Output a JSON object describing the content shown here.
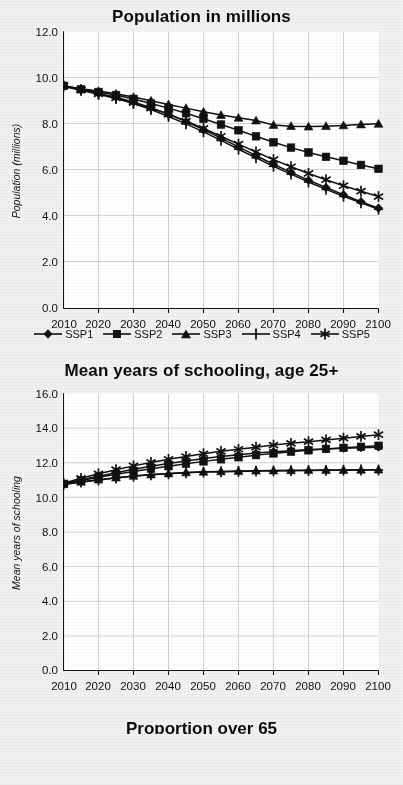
{
  "page": {
    "background_color": "#f1f1ef",
    "plot_background_color": "#ffffff",
    "line_color": "#111111",
    "grid_color": "#cccccc"
  },
  "figure": {
    "panels": [
      {
        "key": "population",
        "title": "Population in millions",
        "ylabel": "Population (millions)",
        "legend_position": "bottom"
      },
      {
        "key": "schooling",
        "title": "Mean years of schooling, age 25+",
        "ylabel": "Mean years of schooling",
        "legend_position": "none"
      }
    ],
    "partial_next_title": "Proportion over 65"
  },
  "legend": {
    "items": [
      {
        "label": "SSP1",
        "marker": "diamond"
      },
      {
        "label": "SSP2",
        "marker": "square"
      },
      {
        "label": "SSP3",
        "marker": "triangle"
      },
      {
        "label": "SSP4",
        "marker": "plus"
      },
      {
        "label": "SSP5",
        "marker": "asterisk"
      }
    ]
  },
  "chart_data": [
    {
      "type": "line",
      "title": "Population in millions",
      "xlabel": "",
      "ylabel": "Population (millions)",
      "xlim": [
        2010,
        2100
      ],
      "ylim": [
        0.0,
        12.0
      ],
      "yticks": [
        "0.0",
        "2.0",
        "4.0",
        "6.0",
        "8.0",
        "10.0",
        "12.0"
      ],
      "xticks": [
        "2010",
        "2020",
        "2030",
        "2040",
        "2050",
        "2060",
        "2070",
        "2080",
        "2090",
        "2100"
      ],
      "grid": true,
      "legend": [
        "SSP1",
        "SSP2",
        "SSP3",
        "SSP4",
        "SSP5"
      ],
      "legend_position": "bottom",
      "x": [
        2010,
        2015,
        2020,
        2025,
        2030,
        2035,
        2040,
        2045,
        2050,
        2055,
        2060,
        2065,
        2070,
        2075,
        2080,
        2085,
        2090,
        2095,
        2100
      ],
      "series": [
        {
          "name": "SSP1",
          "marker": "diamond",
          "values": [
            9.65,
            9.48,
            9.32,
            9.15,
            8.95,
            8.7,
            8.42,
            8.1,
            7.75,
            7.38,
            7.0,
            6.62,
            6.25,
            5.9,
            5.56,
            5.24,
            4.93,
            4.63,
            4.35
          ]
        },
        {
          "name": "SSP2",
          "marker": "square",
          "values": [
            9.65,
            9.5,
            9.38,
            9.25,
            9.08,
            8.88,
            8.68,
            8.46,
            8.22,
            7.97,
            7.72,
            7.46,
            7.2,
            6.97,
            6.76,
            6.57,
            6.4,
            6.22,
            6.05
          ]
        },
        {
          "name": "SSP3",
          "marker": "triangle",
          "values": [
            9.65,
            9.52,
            9.42,
            9.3,
            9.16,
            9.0,
            8.84,
            8.68,
            8.52,
            8.38,
            8.26,
            8.14,
            7.95,
            7.9,
            7.88,
            7.9,
            7.93,
            7.97,
            8.0
          ]
        },
        {
          "name": "SSP4",
          "marker": "plus",
          "values": [
            9.62,
            9.45,
            9.28,
            9.1,
            8.88,
            8.62,
            8.32,
            8.0,
            7.65,
            7.28,
            6.9,
            6.53,
            6.16,
            5.82,
            5.48,
            5.16,
            4.86,
            4.58,
            4.3
          ]
        },
        {
          "name": "SSP5",
          "marker": "asterisk",
          "values": [
            9.65,
            9.47,
            9.3,
            9.12,
            8.92,
            8.68,
            8.42,
            8.12,
            7.8,
            7.46,
            7.12,
            6.78,
            6.45,
            6.14,
            5.85,
            5.58,
            5.32,
            5.08,
            4.85
          ]
        }
      ]
    },
    {
      "type": "line",
      "title": "Mean years of schooling, age 25+",
      "xlabel": "",
      "ylabel": "Mean years of schooling",
      "xlim": [
        2010,
        2100
      ],
      "ylim": [
        0.0,
        16.0
      ],
      "yticks": [
        "0.0",
        "2.0",
        "4.0",
        "6.0",
        "8.0",
        "10.0",
        "12.0",
        "14.0",
        "16.0"
      ],
      "xticks": [
        "2010",
        "2020",
        "2030",
        "2040",
        "2050",
        "2060",
        "2070",
        "2080",
        "2090",
        "2100"
      ],
      "grid": true,
      "legend": [
        "SSP1",
        "SSP2",
        "SSP3",
        "SSP4",
        "SSP5"
      ],
      "legend_position": "none",
      "x": [
        2010,
        2015,
        2020,
        2025,
        2030,
        2035,
        2040,
        2045,
        2050,
        2055,
        2060,
        2065,
        2070,
        2075,
        2080,
        2085,
        2090,
        2095,
        2100
      ],
      "series": [
        {
          "name": "SSP1",
          "marker": "diamond",
          "values": [
            10.8,
            11.02,
            11.22,
            11.42,
            11.62,
            11.8,
            11.96,
            12.1,
            12.24,
            12.36,
            12.46,
            12.56,
            12.64,
            12.7,
            12.76,
            12.8,
            12.84,
            12.87,
            12.9
          ]
        },
        {
          "name": "SSP2",
          "marker": "square",
          "values": [
            10.78,
            10.98,
            11.16,
            11.34,
            11.5,
            11.66,
            11.8,
            11.94,
            12.08,
            12.2,
            12.32,
            12.44,
            12.54,
            12.64,
            12.72,
            12.8,
            12.86,
            12.92,
            12.98
          ]
        },
        {
          "name": "SSP3",
          "marker": "triangle",
          "values": [
            10.76,
            10.9,
            11.02,
            11.14,
            11.24,
            11.32,
            11.38,
            11.44,
            11.48,
            11.5,
            11.52,
            11.54,
            11.55,
            11.56,
            11.57,
            11.58,
            11.58,
            11.59,
            11.6
          ]
        },
        {
          "name": "SSP4",
          "marker": "plus",
          "values": [
            10.74,
            10.88,
            11.0,
            11.12,
            11.22,
            11.3,
            11.36,
            11.42,
            11.46,
            11.48,
            11.5,
            11.52,
            11.53,
            11.54,
            11.55,
            11.56,
            11.57,
            11.58,
            11.58
          ]
        },
        {
          "name": "SSP5",
          "marker": "asterisk",
          "values": [
            10.82,
            11.1,
            11.36,
            11.6,
            11.82,
            12.02,
            12.2,
            12.36,
            12.52,
            12.66,
            12.78,
            12.9,
            13.02,
            13.12,
            13.22,
            13.32,
            13.42,
            13.52,
            13.62
          ]
        }
      ]
    }
  ]
}
